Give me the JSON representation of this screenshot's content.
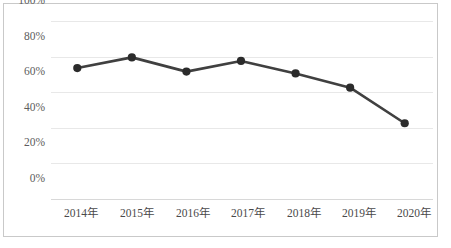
{
  "chart_data": {
    "type": "line",
    "title": "",
    "subtitle": "",
    "xlabel": "",
    "ylabel": "",
    "categories": [
      "2014年",
      "2015年",
      "2016年",
      "2017年",
      "2018年",
      "2019年",
      "2020年"
    ],
    "values": [
      73,
      79,
      71,
      77,
      70,
      62,
      42
    ],
    "series": [
      {
        "name": "",
        "values": [
          73,
          79,
          71,
          77,
          70,
          62,
          42
        ]
      }
    ],
    "ylim": [
      0,
      100
    ],
    "yticks": [
      0,
      20,
      40,
      60,
      80,
      100
    ],
    "ytick_labels": [
      "0%",
      "20%",
      "40%",
      "60%",
      "80%",
      "100%"
    ],
    "grid": true,
    "grid_axis": "y",
    "legend": false,
    "legend_position": "none",
    "value_format": "percent",
    "marker": "circle",
    "colors": {
      "line": "#404040",
      "marker": "#2b2b2b",
      "gridline": "#e8e8e8",
      "axis": "#d8d8d8",
      "frame_border": "#c9c9c9",
      "tick_label": "#4a4a4a",
      "background": "#ffffff"
    }
  }
}
